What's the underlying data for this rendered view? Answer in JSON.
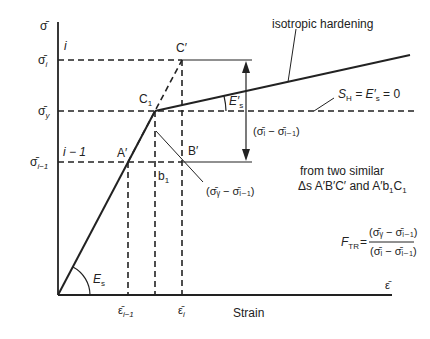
{
  "diagram": {
    "axes": {
      "y_axis_symbol": "σ̄",
      "x_axis_symbol": "ε̄",
      "x_label": "Strain"
    },
    "y_ticks": {
      "sigma_i": "σ̄",
      "sigma_i_sub": "i",
      "sigma_y": "σ̄",
      "sigma_y_sub": "y",
      "sigma_im1": "σ̄",
      "sigma_im1_sub": "i−1"
    },
    "x_ticks": {
      "eps_im1": "ε̄",
      "eps_im1_sub": "i−1",
      "eps_i": "ε̄",
      "eps_i_sub": "i"
    },
    "step_labels": {
      "i": "i",
      "i_minus_1": "i − 1"
    },
    "points": {
      "C_prime": "C′",
      "C1": "C",
      "C1_sub": "1",
      "A_prime": "A′",
      "B_prime": "B′",
      "b1": "b",
      "b1_sub": "1"
    },
    "annotations": {
      "isotropic_hardening": "isotropic hardening",
      "Es": "E",
      "Es_sub": "s",
      "Es_prime": "E′",
      "Es_prime_sub": "s",
      "SH_eq": "S",
      "SH_sub": "H",
      "SH_rest": " = E′",
      "SH_rest_sub": "s",
      "SH_tail": " = 0",
      "diff_i": "(σ̄ᵢ − σ̄ᵢ₋₁)",
      "diff_y": "(σ̄ᵧ − σ̄ᵢ₋₁)",
      "similar_line1": "from two similar",
      "similar_line2": "Δs A′B′C′ and A′b",
      "similar_line2_sub": "1",
      "similar_line2_end": "C",
      "similar_line2_end_sub": "1",
      "FTR": "F",
      "FTR_sub": "TR",
      "FTR_eq": "=",
      "FTR_numerator": "(σ̄ᵧ − σ̄ᵢ₋₁)",
      "FTR_denominator": "(σ̄ᵢ − σ̄ᵢ₋₁)"
    },
    "colors": {
      "line": "#222222",
      "background": "#ffffff"
    }
  }
}
